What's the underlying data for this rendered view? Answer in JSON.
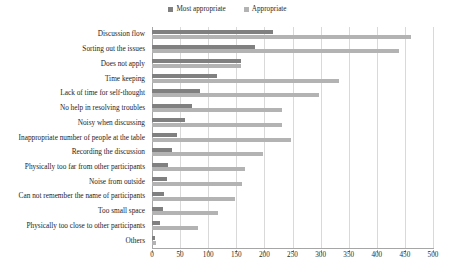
{
  "legend": {
    "entries": [
      {
        "label": "Most appropriate",
        "color": "#808080",
        "name": "legend-most-appropriate"
      },
      {
        "label": "Appropriate",
        "color": "#b3b3b3",
        "name": "legend-appropriate"
      }
    ]
  },
  "axis": {
    "x_ticks": [
      "0",
      "50",
      "100",
      "150",
      "200",
      "250",
      "300",
      "350",
      "400",
      "450",
      "500"
    ]
  },
  "chart_data": {
    "type": "bar",
    "orientation": "horizontal",
    "title": "",
    "xlabel": "",
    "ylabel": "",
    "xlim": [
      0,
      500
    ],
    "xtick_step": 50,
    "grid": true,
    "legend_position": "top-center",
    "categories": [
      "Discussion flow",
      "Sorting out the issues",
      "Does not apply",
      "Time keeping",
      "Lack of time for self-thought",
      "No help in resolving troubles",
      "Noisy when discussing",
      "Inappropriate number of  people at the table",
      "Recording the discussion",
      "Physically too far from other participants",
      "Noise from outside",
      "Can not remember the name of participants",
      "Too small space",
      "Physically too close to other participants",
      "Others"
    ],
    "series": [
      {
        "name": "Most appropriate",
        "color": "#808080",
        "values": [
          215,
          183,
          158,
          115,
          85,
          72,
          58,
          45,
          35,
          28,
          26,
          22,
          20,
          14,
          5
        ]
      },
      {
        "name": "Appropriate",
        "color": "#b3b3b3",
        "values": [
          460,
          440,
          158,
          332,
          298,
          232,
          232,
          248,
          197,
          165,
          160,
          148,
          117,
          82,
          8
        ]
      }
    ]
  }
}
